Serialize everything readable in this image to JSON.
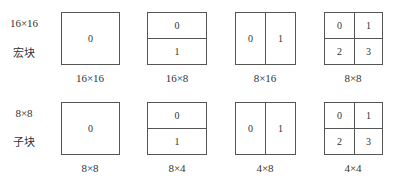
{
  "rows": [
    {
      "side_label_top": "16×16",
      "side_label_bottom": "宏块",
      "partitions": [
        {
          "type": "whole",
          "cells": [
            "0"
          ],
          "caption": "16×16"
        },
        {
          "type": "horizontal",
          "cells": [
            "0",
            "1"
          ],
          "caption": "16×8"
        },
        {
          "type": "vertical",
          "cells": [
            "0",
            "1"
          ],
          "caption": "8×16"
        },
        {
          "type": "quad",
          "cells": [
            "0",
            "1",
            "2",
            "3"
          ],
          "caption": "8×8"
        }
      ]
    },
    {
      "side_label_top": "8×8",
      "side_label_bottom": "子块",
      "partitions": [
        {
          "type": "whole",
          "cells": [
            "0"
          ],
          "caption": "8×8"
        },
        {
          "type": "horizontal",
          "cells": [
            "0",
            "1"
          ],
          "caption": "8×4"
        },
        {
          "type": "vertical",
          "cells": [
            "0",
            "1"
          ],
          "caption": "4×8"
        },
        {
          "type": "quad",
          "cells": [
            "0",
            "1",
            "2",
            "3"
          ],
          "caption": "4×4"
        }
      ]
    }
  ]
}
